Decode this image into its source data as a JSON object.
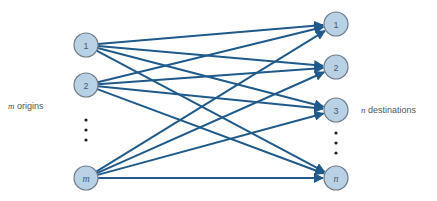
{
  "diagram": {
    "title": "",
    "colors": {
      "edge": "#1f5a8a",
      "node_fill": "#b8d1e5",
      "node_stroke": "#707c88",
      "text": "#4a5a68",
      "dots": "#222222"
    },
    "labels": {
      "origins_var": "m",
      "origins_text": " origins",
      "destinations_var": "n",
      "destinations_text": " destinations"
    },
    "origins": [
      {
        "id": "o1",
        "label": "1",
        "italic": false,
        "x": 86,
        "y": 45
      },
      {
        "id": "o2",
        "label": "2",
        "italic": false,
        "x": 86,
        "y": 85
      },
      {
        "id": "om",
        "label": "m",
        "italic": true,
        "x": 86,
        "y": 178
      }
    ],
    "destinations": [
      {
        "id": "d1",
        "label": "1",
        "italic": false,
        "x": 336,
        "y": 24
      },
      {
        "id": "d2",
        "label": "2",
        "italic": false,
        "x": 336,
        "y": 67
      },
      {
        "id": "d3",
        "label": "3",
        "italic": false,
        "x": 336,
        "y": 110
      },
      {
        "id": "dn",
        "label": "n",
        "italic": true,
        "x": 336,
        "y": 178
      }
    ],
    "node_radius": 12,
    "edges": "complete bipartite: every origin connects to every destination with an arrow",
    "ellipsis_origins": {
      "x": 86,
      "ys": [
        120,
        130,
        140
      ]
    },
    "ellipsis_destinations": {
      "x": 336,
      "ys": [
        133,
        143,
        153
      ]
    }
  }
}
